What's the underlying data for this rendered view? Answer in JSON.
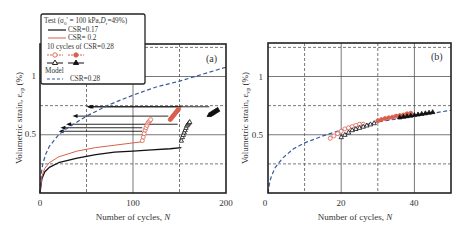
{
  "chart_data": [
    {
      "panel": "(a)",
      "type": "line",
      "xlabel": "Number of cycles, N",
      "ylabel": "Volumetric strain, εvp (%)",
      "xlim": [
        0,
        200
      ],
      "ylim": [
        0,
        1.3
      ],
      "xticks": [
        0,
        100,
        200
      ],
      "yticks": [
        0.5,
        1
      ],
      "grid": {
        "solid_x": [
          100
        ],
        "dashed_x": [
          50,
          150
        ],
        "solid_y": [
          0.5,
          1.0
        ],
        "dashed_y": [
          0.25,
          0.75,
          1.25
        ]
      },
      "legend": {
        "title": "Test (σ0' = 100 kPa, Dr=49%)",
        "entries": [
          "CSR=0.17",
          "CSR= 0.2",
          "10 cycles of CSR=0.28",
          "Model",
          "CSR=0.28"
        ]
      },
      "series": [
        {
          "name": "CSR=0.17",
          "style": "solid",
          "color": "#111111",
          "x": [
            0,
            2,
            5,
            10,
            20,
            40,
            60,
            80,
            100,
            120,
            140,
            152
          ],
          "y": [
            0,
            0.12,
            0.18,
            0.22,
            0.26,
            0.3,
            0.33,
            0.35,
            0.36,
            0.37,
            0.38,
            0.39
          ]
        },
        {
          "name": "CSR= 0.2",
          "style": "solid",
          "color": "#d9604d",
          "x": [
            0,
            2,
            5,
            10,
            20,
            40,
            60,
            80,
            100,
            110
          ],
          "y": [
            0,
            0.14,
            0.21,
            0.26,
            0.31,
            0.36,
            0.39,
            0.41,
            0.43,
            0.44
          ]
        },
        {
          "name": "10 cycles of CSR=0.28 (after CSR=0.2, open)",
          "style": "marker-circle-open",
          "color": "#d9604d",
          "x": [
            110,
            111,
            112,
            113,
            114,
            115,
            116,
            117,
            118,
            119
          ],
          "y": [
            0.45,
            0.48,
            0.51,
            0.54,
            0.56,
            0.58,
            0.6,
            0.61,
            0.62,
            0.63
          ]
        },
        {
          "name": "10 cycles of CSR=0.28 (after CSR=0.2, filled)",
          "style": "marker-circle-filled",
          "color": "#d9604d",
          "x": [
            140,
            141,
            142,
            143,
            144,
            145,
            146,
            147,
            148,
            149
          ],
          "y": [
            0.63,
            0.64,
            0.65,
            0.66,
            0.67,
            0.68,
            0.69,
            0.7,
            0.71,
            0.72
          ]
        },
        {
          "name": "10 cycles of CSR=0.28 (after CSR=0.17, open)",
          "style": "marker-triangle-open",
          "color": "#111111",
          "x": [
            152,
            153,
            154,
            155,
            156,
            157,
            158,
            159,
            160,
            161
          ],
          "y": [
            0.45,
            0.48,
            0.5,
            0.52,
            0.54,
            0.56,
            0.58,
            0.59,
            0.6,
            0.61
          ]
        },
        {
          "name": "10 cycles of CSR=0.28 (after CSR=0.17, filled)",
          "style": "marker-triangle-filled",
          "color": "#111111",
          "x": [
            182,
            183,
            184,
            185,
            186,
            187,
            188,
            189,
            190,
            191
          ],
          "y": [
            0.67,
            0.675,
            0.68,
            0.685,
            0.69,
            0.695,
            0.7,
            0.705,
            0.71,
            0.715
          ]
        },
        {
          "name": "Model CSR=0.28",
          "style": "dashed",
          "color": "#3a5a9a",
          "x": [
            0,
            1,
            3,
            6,
            10,
            20,
            30,
            50,
            75,
            100,
            125,
            150,
            175,
            200
          ],
          "y": [
            0,
            0.15,
            0.25,
            0.33,
            0.4,
            0.5,
            0.56,
            0.66,
            0.76,
            0.84,
            0.91,
            0.96,
            1.02,
            1.08
          ]
        }
      ],
      "arrows": [
        {
          "from_x": 152,
          "to_x": 50,
          "y": 0.74
        },
        {
          "from_x": 182,
          "to_x": 52,
          "y": 0.74
        },
        {
          "from_x": 138,
          "to_x": 35,
          "y": 0.66
        },
        {
          "from_x": 110,
          "to_x": 22,
          "y": 0.56
        },
        {
          "from_x": 148,
          "to_x": 28,
          "y": 0.59
        },
        {
          "from_x": 110,
          "to_x": 20,
          "y": 0.53
        }
      ],
      "annotations": [
        "(a)"
      ]
    },
    {
      "panel": "(b)",
      "type": "scatter",
      "xlabel": "Number of cycles, N",
      "ylabel": "Volumetric strain, εvp (%)",
      "xlim": [
        0,
        50
      ],
      "ylim": [
        0,
        1.3
      ],
      "xticks": [
        0,
        20,
        40
      ],
      "yticks": [
        0.5,
        1
      ],
      "grid": {
        "solid_x": [
          20,
          40
        ],
        "dashed_x": [
          10,
          30
        ],
        "solid_y": [
          0.5,
          1.0
        ],
        "dashed_y": [
          0.25,
          0.75,
          1.25
        ]
      },
      "series": [
        {
          "name": "Model CSR=0.28",
          "style": "dashed",
          "color": "#3a5a9a",
          "x": [
            0,
            0.5,
            1,
            2,
            4,
            7,
            10,
            15,
            20,
            30,
            40,
            50
          ],
          "y": [
            0,
            0.1,
            0.15,
            0.22,
            0.3,
            0.38,
            0.43,
            0.49,
            0.54,
            0.61,
            0.66,
            0.71
          ]
        },
        {
          "name": "CSR=0.2 then 0.28 (open)",
          "style": "marker-circle-open",
          "color": "#d9604d",
          "x": [
            17,
            18,
            19,
            20,
            21,
            22,
            23,
            24,
            25,
            26
          ],
          "y": [
            0.47,
            0.49,
            0.51,
            0.53,
            0.55,
            0.56,
            0.57,
            0.58,
            0.59,
            0.59
          ]
        },
        {
          "name": "CSR=0.2 then 0.28 (filled)",
          "style": "marker-circle-filled",
          "color": "#d9604d",
          "x": [
            30,
            31,
            32,
            33,
            34,
            35,
            36,
            37,
            38,
            39
          ],
          "y": [
            0.62,
            0.63,
            0.64,
            0.645,
            0.65,
            0.66,
            0.665,
            0.67,
            0.68,
            0.685
          ]
        },
        {
          "name": "CSR=0.17 then 0.28 (open)",
          "style": "marker-triangle-open",
          "color": "#111111",
          "x": [
            20,
            21,
            22,
            23,
            24,
            25,
            26,
            27,
            28,
            29
          ],
          "y": [
            0.48,
            0.5,
            0.52,
            0.54,
            0.55,
            0.56,
            0.57,
            0.58,
            0.59,
            0.6
          ]
        },
        {
          "name": "CSR=0.17 then 0.28 (filled)",
          "style": "marker-triangle-filled",
          "color": "#111111",
          "x": [
            36,
            37,
            38,
            39,
            40,
            41,
            42,
            43,
            44,
            45
          ],
          "y": [
            0.65,
            0.655,
            0.66,
            0.665,
            0.67,
            0.675,
            0.68,
            0.685,
            0.69,
            0.695
          ]
        }
      ],
      "annotations": [
        "(b)"
      ]
    }
  ],
  "labels": {
    "panel_a": "(a)",
    "panel_b": "(b)",
    "xlabel": "Number of cycles, ",
    "xlabel_var": "N",
    "ylabel": "Volumetric strain, ε",
    "ylabel_sub": "vp",
    "ylabel_unit": " (%)",
    "legend_title": "Test (σ",
    "legend_title_sub": "0",
    "legend_title_rest": "' = 100 kPa,",
    "legend_dr": "D",
    "legend_dr_sub": "r",
    "legend_dr_rest": "=49%)",
    "legend_csr017": "CSR=0.17",
    "legend_csr02": "CSR= 0.2",
    "legend_10cycles": "10 cycles of CSR=0.28",
    "legend_model": "Model",
    "legend_model_csr": "CSR=0.28",
    "a_xticks": [
      "0",
      "100",
      "200"
    ],
    "b_xticks": [
      "0",
      "20",
      "40"
    ],
    "yticks": [
      "0.5",
      "1"
    ]
  },
  "colors": {
    "black": "#111111",
    "red": "#d9604d",
    "model": "#3a5a9a",
    "grid": "#555555"
  }
}
